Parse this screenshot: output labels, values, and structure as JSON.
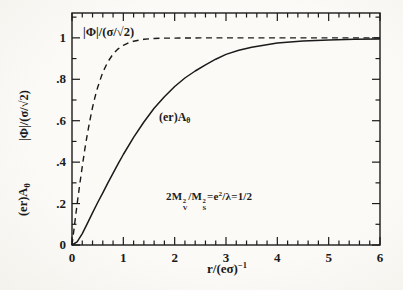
{
  "page": {
    "background": "#faf9f5",
    "ink": "#1a1a1a"
  },
  "chart_data": {
    "type": "line",
    "title": "",
    "xlabel_base": "r/(eσ)",
    "xlabel_sup": "−1",
    "ylabel_upper": "|Φ|/(σ/√2)",
    "ylabel_lower_base": "(er)A",
    "ylabel_lower_sub": "θ",
    "xlim": [
      0,
      6
    ],
    "ylim": [
      0,
      1.12
    ],
    "x_major_ticks": [
      0,
      1,
      2,
      3,
      4,
      5,
      6
    ],
    "x_tick_labels": [
      "0",
      "1",
      "2",
      "3",
      "4",
      "5",
      "6"
    ],
    "x_minor_step": 0.2,
    "y_major_ticks": [
      0,
      0.2,
      0.4,
      0.6,
      0.8,
      1
    ],
    "y_tick_labels": [
      "0",
      ".2",
      ".4",
      ".6",
      ".8",
      "1"
    ],
    "y_minor_step": 0.1,
    "grid": false,
    "legend": "inline-curve-labels",
    "series": [
      {
        "name": "|Φ|/(σ/√2)",
        "style": "dashed",
        "x": [
          0,
          0.05,
          0.1,
          0.15,
          0.2,
          0.25,
          0.3,
          0.35,
          0.4,
          0.45,
          0.5,
          0.6,
          0.7,
          0.8,
          0.9,
          1.0,
          1.1,
          1.2,
          1.4,
          1.6,
          1.8,
          2.0,
          2.5,
          3.0,
          4.0,
          5.0,
          6.0
        ],
        "y": [
          0,
          0.1,
          0.197,
          0.291,
          0.38,
          0.462,
          0.537,
          0.604,
          0.664,
          0.716,
          0.762,
          0.834,
          0.885,
          0.922,
          0.947,
          0.964,
          0.976,
          0.984,
          0.993,
          0.997,
          0.999,
          0.999,
          1.0,
          1.0,
          1.0,
          1.0,
          1.0
        ]
      },
      {
        "name": "(er)Aθ",
        "label_base": "(er)A",
        "label_sub": "θ",
        "style": "solid",
        "x": [
          0,
          0.1,
          0.2,
          0.3,
          0.4,
          0.5,
          0.6,
          0.7,
          0.8,
          0.9,
          1.0,
          1.2,
          1.4,
          1.6,
          1.8,
          2.0,
          2.2,
          2.4,
          2.6,
          2.8,
          3.0,
          3.25,
          3.5,
          4.0,
          4.5,
          5.0,
          5.5,
          6.0
        ],
        "y": [
          0,
          0.015,
          0.055,
          0.105,
          0.155,
          0.205,
          0.252,
          0.3,
          0.347,
          0.393,
          0.437,
          0.52,
          0.594,
          0.66,
          0.716,
          0.765,
          0.806,
          0.84,
          0.87,
          0.897,
          0.92,
          0.94,
          0.955,
          0.975,
          0.985,
          0.99,
          0.993,
          0.995
        ]
      }
    ]
  },
  "annotation": {
    "p1": "2M",
    "m1_sup": "2",
    "m1_sub": "V",
    "p2": "/M",
    "m2_sup": "2",
    "m2_sub": "S",
    "p3": "=e",
    "e_sup": "2",
    "p4": "/λ=1/2",
    "full": "2M_V^2/M_S^2 = e^2/λ = 1/2"
  }
}
